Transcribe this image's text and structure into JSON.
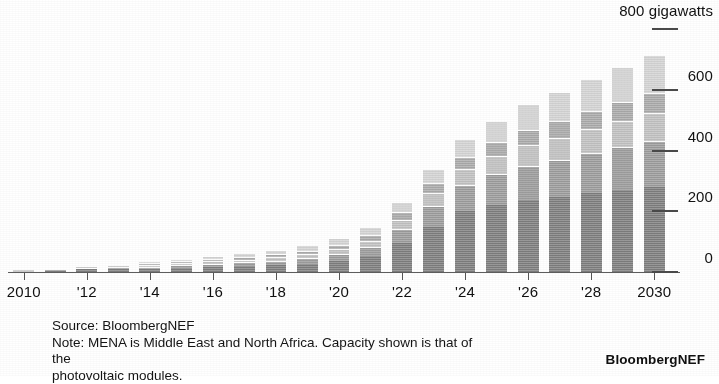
{
  "chart_data": {
    "type": "bar",
    "stacked": true,
    "title": "",
    "subtitle": "",
    "xlabel": "",
    "ylabel": "gigawatts",
    "axis_unit_label": "800 gigawatts",
    "ylim": [
      0,
      800
    ],
    "yticks": [
      0,
      200,
      400,
      600,
      800
    ],
    "ytick_labels": [
      "0",
      "200",
      "400",
      "600",
      "800 gigawatts"
    ],
    "grid": false,
    "legend_position": "none",
    "x": [
      2010,
      2011,
      2012,
      2013,
      2014,
      2015,
      2016,
      2017,
      2018,
      2019,
      2020,
      2021,
      2022,
      2023,
      2024,
      2025,
      2026,
      2027,
      2028,
      2029,
      2030
    ],
    "categories": [
      "2010",
      "2011",
      "2012",
      "2013",
      "2014",
      "2015",
      "2016",
      "2017",
      "2018",
      "2019",
      "2020",
      "2021",
      "2022",
      "2023",
      "2024",
      "2025",
      "2026",
      "2027",
      "2028",
      "2029",
      "2030"
    ],
    "xtick_labels": [
      "2010",
      "'12",
      "'14",
      "'16",
      "'18",
      "'20",
      "'22",
      "'24",
      "'26",
      "'28",
      "2030"
    ],
    "xtick_values": [
      2010,
      2012,
      2014,
      2016,
      2018,
      2020,
      2022,
      2024,
      2026,
      2028,
      2030
    ],
    "series": [
      {
        "name": "China",
        "color": "#7c7c7c",
        "values": [
          3,
          8,
          12,
          14,
          14,
          17,
          19,
          22,
          26,
          30,
          40,
          55,
          100,
          150,
          205,
          225,
          240,
          250,
          262,
          272,
          282
        ]
      },
      {
        "name": "Rest of world",
        "color": "#9a9a9a",
        "values": [
          2,
          4,
          5,
          6,
          7,
          9,
          11,
          13,
          15,
          18,
          22,
          30,
          45,
          70,
          85,
          100,
          112,
          122,
          132,
          142,
          152
        ]
      },
      {
        "name": "Europe",
        "color": "#bfbfbf",
        "values": [
          4,
          6,
          7,
          6,
          6,
          7,
          8,
          9,
          11,
          14,
          16,
          22,
          30,
          42,
          52,
          60,
          68,
          74,
          80,
          86,
          92
        ]
      },
      {
        "name": "US",
        "color": "#a8a8a8",
        "values": [
          1,
          2,
          3,
          4,
          5,
          6,
          7,
          9,
          10,
          12,
          15,
          19,
          25,
          34,
          40,
          45,
          50,
          54,
          58,
          62,
          66
        ]
      },
      {
        "name": "India & MENA",
        "color": "#d2d2d2",
        "values": [
          1,
          2,
          3,
          4,
          6,
          8,
          10,
          12,
          14,
          17,
          21,
          27,
          35,
          48,
          60,
          72,
          85,
          95,
          106,
          116,
          126
        ]
      }
    ],
    "totals": [
      11,
      22,
      30,
      34,
      38,
      47,
      55,
      65,
      76,
      91,
      114,
      153,
      235,
      344,
      442,
      502,
      555,
      595,
      638,
      678,
      718
    ]
  },
  "yaxis": {
    "unit_label": "800 gigawatts",
    "ticks": [
      {
        "value": 800,
        "label": "800 gigawatts"
      },
      {
        "value": 600,
        "label": "600"
      },
      {
        "value": 400,
        "label": "400"
      },
      {
        "value": 200,
        "label": "200"
      },
      {
        "value": 0,
        "label": "0"
      }
    ]
  },
  "footer": {
    "source": "Source: BloombergNEF",
    "note_line1": "Note: MENA is Middle East and North Africa. Capacity shown is that of the",
    "note_line2": "photovoltaic modules.",
    "brand": "BloombergNEF"
  },
  "colors": {
    "segment_1": "#7c7c7c",
    "segment_2": "#9a9a9a",
    "segment_3": "#bfbfbf",
    "segment_4": "#a8a8a8",
    "segment_5": "#d2d2d2",
    "axis": "#5d5d5d",
    "text": "#111111",
    "background": "#ffffff"
  }
}
